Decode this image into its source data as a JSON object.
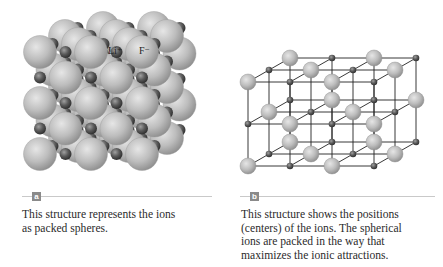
{
  "figure": {
    "panels": [
      {
        "id": "a",
        "label": "a",
        "type": "space-filling model of lithium fluoride crystal",
        "ion_labels": {
          "cation": "Li⁺",
          "anion": "F⁻"
        },
        "caption": "This structure represents the ions as packed spheres.",
        "caption_lines": [
          "This structure represents the ions",
          "as packed spheres."
        ]
      },
      {
        "id": "b",
        "label": "b",
        "type": "ball-and-stick lattice model",
        "caption": "This structure shows the positions (centers) of the ions. The spherical ions are packed in the way that maximizes the ionic attractions.",
        "caption_lines": [
          "This structure shows the positions",
          "(centers) of the ions. The spherical",
          "ions are packed in the way that",
          "maximizes the ionic attractions."
        ]
      }
    ],
    "colors": {
      "large_ion": "#b9b9b9",
      "small_ion": "#555555",
      "lattice_line": "#222222",
      "badge": "#8a8a8a",
      "rule": "#c9c9c9"
    }
  }
}
